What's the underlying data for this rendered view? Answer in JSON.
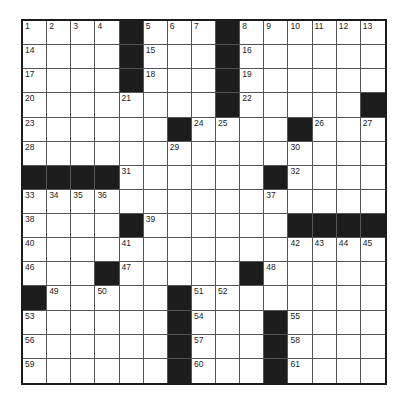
{
  "puzzle": {
    "rows": 15,
    "cols": 15,
    "colors": {
      "black": "#1c1c1c",
      "white": "#ffffff",
      "border": "#1a1a1a",
      "gridline": "#555555"
    },
    "grid": [
      "....#...#......",
      "....#...#......",
      "....#...#......",
      "........#.....#",
      "......#....#...",
      "...............",
      "####......#....",
      "...............",
      "....#......####",
      "...............",
      "...#.....#.....",
      "#.....#........",
      "......#...#....",
      "......#...#....",
      "......#...#...."
    ],
    "numbers": [
      [
        1,
        2,
        3,
        4,
        0,
        5,
        6,
        7,
        0,
        8,
        9,
        10,
        11,
        12,
        13
      ],
      [
        14,
        0,
        0,
        0,
        0,
        15,
        0,
        0,
        0,
        16,
        0,
        0,
        0,
        0,
        0
      ],
      [
        17,
        0,
        0,
        0,
        0,
        18,
        0,
        0,
        0,
        19,
        0,
        0,
        0,
        0,
        0
      ],
      [
        20,
        0,
        0,
        0,
        21,
        0,
        0,
        0,
        0,
        22,
        0,
        0,
        0,
        0,
        0
      ],
      [
        23,
        0,
        0,
        0,
        0,
        0,
        0,
        24,
        25,
        0,
        0,
        0,
        26,
        0,
        27
      ],
      [
        28,
        0,
        0,
        0,
        0,
        0,
        29,
        0,
        0,
        0,
        0,
        30,
        0,
        0,
        0
      ],
      [
        0,
        0,
        0,
        0,
        31,
        0,
        0,
        0,
        0,
        0,
        0,
        32,
        0,
        0,
        0
      ],
      [
        33,
        34,
        35,
        36,
        0,
        0,
        0,
        0,
        0,
        0,
        37,
        0,
        0,
        0,
        0
      ],
      [
        38,
        0,
        0,
        0,
        0,
        39,
        0,
        0,
        0,
        0,
        0,
        0,
        0,
        0,
        0
      ],
      [
        40,
        0,
        0,
        0,
        41,
        0,
        0,
        0,
        0,
        0,
        0,
        42,
        43,
        44,
        45
      ],
      [
        46,
        0,
        0,
        0,
        47,
        0,
        0,
        0,
        0,
        0,
        48,
        0,
        0,
        0,
        0
      ],
      [
        0,
        49,
        0,
        50,
        0,
        0,
        0,
        51,
        52,
        0,
        0,
        0,
        0,
        0,
        0
      ],
      [
        53,
        0,
        0,
        0,
        0,
        0,
        0,
        54,
        0,
        0,
        0,
        55,
        0,
        0,
        0
      ],
      [
        56,
        0,
        0,
        0,
        0,
        0,
        0,
        57,
        0,
        0,
        0,
        58,
        0,
        0,
        0
      ],
      [
        59,
        0,
        0,
        0,
        0,
        0,
        0,
        60,
        0,
        0,
        0,
        61,
        0,
        0,
        0
      ]
    ]
  }
}
